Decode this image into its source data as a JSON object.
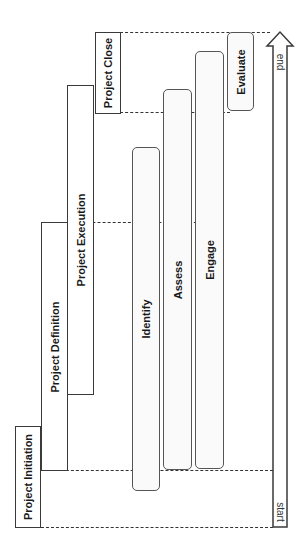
{
  "diagram": {
    "phases": [
      {
        "label": "Project Initiation"
      },
      {
        "label": "Project Definition"
      },
      {
        "label": "Project Execution"
      },
      {
        "label": "Project Close"
      }
    ],
    "activities": [
      {
        "label": "Identify"
      },
      {
        "label": "Assess"
      },
      {
        "label": "Engage"
      },
      {
        "label": "Evaluate"
      }
    ],
    "timeline": {
      "start_label": "start",
      "end_label": "end"
    },
    "colors": {
      "stroke": "#3a3a3a",
      "background": "#ffffff"
    }
  }
}
